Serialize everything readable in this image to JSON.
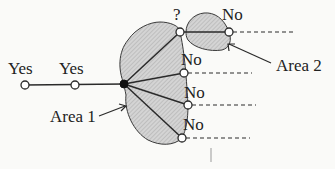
{
  "diagram": {
    "labels": {
      "yes1": "Yes",
      "yes2": "Yes",
      "question": "?",
      "no_top": "No",
      "no1": "No",
      "no2": "No",
      "no3": "No",
      "area1": "Area 1",
      "area2": "Area 2"
    },
    "colors": {
      "line": "#2a2a2a",
      "fill": "#c8c8c8",
      "background": "#fafaf8"
    }
  }
}
